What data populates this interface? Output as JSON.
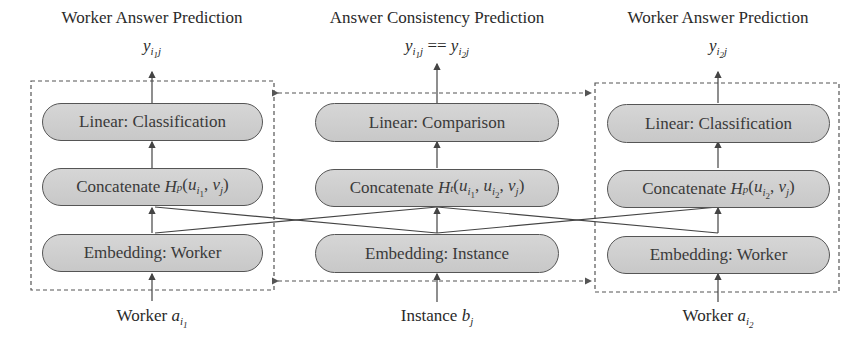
{
  "columns": {
    "left": {
      "title": "Worker Answer Prediction",
      "output": {
        "base": "y",
        "sub": "i",
        "subsub": "1",
        "tail": "j"
      },
      "nodes": {
        "linear": "Linear: Classification",
        "concat_prefix": "Concatenate ",
        "concat_fn": "H",
        "concat_fn_sub": "p",
        "concat_args": "(u_{i1}, v_j)",
        "embedding": "Embedding: Worker"
      },
      "input": {
        "label": "Worker ",
        "var": "a",
        "sub": "i",
        "subsub": "1"
      }
    },
    "middle": {
      "title": "Answer Consistency Prediction",
      "output": "y_{i1 j} == y_{i2 j}",
      "output_op": "==",
      "nodes": {
        "linear": "Linear: Comparison",
        "concat_prefix": "Concatenate ",
        "concat_fn": "H",
        "concat_fn_sub": "t",
        "concat_args": "(u_{i1}, u_{i2}, v_j)",
        "embedding": "Embedding: Instance"
      },
      "input": {
        "label": "Instance ",
        "var": "b",
        "sub": "j"
      }
    },
    "right": {
      "title": "Worker Answer Prediction",
      "output": {
        "base": "y",
        "sub": "i",
        "subsub": "2",
        "tail": "j"
      },
      "nodes": {
        "linear": "Linear: Classification",
        "concat_prefix": "Concatenate ",
        "concat_fn": "H",
        "concat_fn_sub": "p",
        "concat_args": "(u_{i2}, v_j)",
        "embedding": "Embedding: Worker"
      },
      "input": {
        "label": "Worker ",
        "var": "a",
        "sub": "i",
        "subsub": "2"
      }
    }
  },
  "colors": {
    "node_fill": "#cfcfcf",
    "node_border": "#555555",
    "line": "#444444",
    "dashed": "#555555",
    "text": "#2a2a2a"
  }
}
